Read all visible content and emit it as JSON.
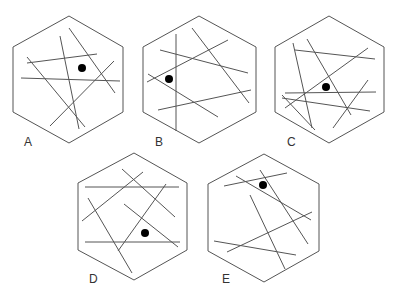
{
  "colors": {
    "outline": "#555555",
    "line": "#555555",
    "dot": "#000000",
    "label": "#333333"
  },
  "figures": [
    {
      "id": "A",
      "label": "A",
      "label_pos": [
        24,
        136
      ],
      "hexagon": [
        [
          69,
          16
        ],
        [
          123,
          47
        ],
        [
          123,
          112
        ],
        [
          69,
          143
        ],
        [
          13,
          112
        ],
        [
          13,
          47
        ]
      ],
      "lines": [
        [
          27,
          63,
          97,
          54
        ],
        [
          21,
          78,
          120,
          81
        ],
        [
          27,
          57,
          85,
          127
        ],
        [
          60,
          36,
          79,
          129
        ],
        [
          69,
          28,
          115,
          93
        ],
        [
          50,
          126,
          114,
          61
        ]
      ],
      "dot": [
        82,
        68
      ]
    },
    {
      "id": "B",
      "label": "B",
      "label_pos": [
        155,
        136
      ],
      "hexagon": [
        [
          199,
          16
        ],
        [
          256,
          47
        ],
        [
          256,
          112
        ],
        [
          199,
          143
        ],
        [
          143,
          112
        ],
        [
          143,
          47
        ]
      ],
      "lines": [
        [
          176,
          34,
          176,
          131
        ],
        [
          192,
          28,
          249,
          103
        ],
        [
          160,
          50,
          248,
          73
        ],
        [
          147,
          82,
          228,
          40
        ],
        [
          148,
          74,
          218,
          117
        ],
        [
          158,
          110,
          251,
          90
        ]
      ],
      "dot": [
        169,
        79
      ]
    },
    {
      "id": "C",
      "label": "C",
      "label_pos": [
        287,
        136
      ],
      "hexagon": [
        [
          329,
          16
        ],
        [
          384,
          47
        ],
        [
          384,
          112
        ],
        [
          329,
          143
        ],
        [
          275,
          112
        ],
        [
          275,
          47
        ]
      ],
      "lines": [
        [
          293,
          43,
          312,
          128
        ],
        [
          307,
          39,
          351,
          115
        ],
        [
          295,
          50,
          375,
          59
        ],
        [
          285,
          108,
          368,
          48
        ],
        [
          285,
          93,
          376,
          92
        ],
        [
          282,
          98,
          370,
          111
        ],
        [
          282,
          95,
          315,
          130
        ],
        [
          333,
          128,
          368,
          80
        ]
      ],
      "dot": [
        326,
        87
      ]
    },
    {
      "id": "D",
      "label": "D",
      "label_pos": [
        89,
        273
      ],
      "hexagon": [
        [
          134,
          153
        ],
        [
          187,
          183
        ],
        [
          187,
          250
        ],
        [
          134,
          280
        ],
        [
          78,
          250
        ],
        [
          78,
          183
        ]
      ],
      "lines": [
        [
          85,
          187,
          179,
          187
        ],
        [
          82,
          221,
          143,
          172
        ],
        [
          122,
          169,
          175,
          217
        ],
        [
          88,
          198,
          132,
          273
        ],
        [
          118,
          251,
          166,
          184
        ],
        [
          124,
          204,
          178,
          247
        ],
        [
          85,
          242,
          180,
          242
        ]
      ],
      "dot": [
        145,
        233
      ]
    },
    {
      "id": "E",
      "label": "E",
      "label_pos": [
        222,
        273
      ],
      "hexagon": [
        [
          264,
          154
        ],
        [
          319,
          184
        ],
        [
          319,
          251
        ],
        [
          264,
          282
        ],
        [
          208,
          251
        ],
        [
          208,
          184
        ]
      ],
      "lines": [
        [
          224,
          186,
          287,
          173
        ],
        [
          236,
          176,
          311,
          220
        ],
        [
          260,
          170,
          308,
          244
        ],
        [
          250,
          195,
          285,
          269
        ],
        [
          227,
          252,
          312,
          212
        ],
        [
          214,
          241,
          296,
          255
        ]
      ],
      "dot": [
        263,
        185
      ]
    }
  ]
}
